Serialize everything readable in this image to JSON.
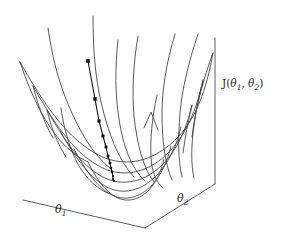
{
  "figure": {
    "background_color": "#ffffff",
    "line_color": "#3c3c3c",
    "axis_color": "#4a4a4a",
    "marker_color": "#111111"
  },
  "labels": {
    "x_axis": {
      "symbol": "θ",
      "subscript": "1",
      "text": "θ1"
    },
    "y_axis": {
      "symbol": "θ",
      "subscript": "2",
      "text": "θ2"
    },
    "z_axis": {
      "prefix": "J(",
      "first": "θ",
      "first_sub": "1",
      "separator": ", ",
      "second": "θ",
      "second_sub": "2",
      "suffix": ")",
      "text": "J(θ1, θ2)"
    }
  },
  "chart_data": {
    "type": "line",
    "xlabel": "θ1",
    "ylabel": "θ2",
    "zlabel": "J(θ1, θ2)",
    "grid": true,
    "legend": null,
    "surface": {
      "function": "J = a*(u^2) + b*(v^2)",
      "description": "Convex paraboloid (bowl) mesh surface",
      "mesh_rows": 7,
      "mesh_cols": 7,
      "u_range": [
        -1,
        1
      ],
      "v_range": [
        -1,
        1
      ],
      "z_range": [
        0,
        1
      ],
      "projection": {
        "type": "oblique-3d",
        "origin_px": [
          145,
          228
        ],
        "x_axis_vector_px": [
          -122,
          -28
        ],
        "y_axis_vector_px": [
          70,
          -44
        ],
        "z_axis_vector_px": [
          0,
          -146
        ]
      }
    },
    "axes": {
      "x_axis_line_px": [
        [
          23,
          200
        ],
        [
          145,
          228
        ]
      ],
      "y_axis_line_px": [
        [
          145,
          228
        ],
        [
          215,
          184
        ]
      ],
      "z_axis_line_px": [
        [
          215,
          184
        ],
        [
          215,
          38
        ]
      ]
    },
    "series": [
      {
        "name": "gradient descent path",
        "marker": "square",
        "markersize": 3,
        "points_uvz": [
          [
            -0.62,
            0.58,
            0.72
          ],
          [
            -0.5,
            0.44,
            0.45
          ],
          [
            -0.41,
            0.35,
            0.3
          ],
          [
            -0.33,
            0.27,
            0.19
          ],
          [
            -0.26,
            0.21,
            0.12
          ],
          [
            -0.2,
            0.16,
            0.07
          ],
          [
            -0.15,
            0.12,
            0.04
          ],
          [
            -0.11,
            0.09,
            0.02
          ],
          [
            -0.08,
            0.06,
            0.01
          ],
          [
            -0.05,
            0.04,
            0.005
          ],
          [
            -0.03,
            0.02,
            0.002
          ],
          [
            -0.01,
            0.01,
            0.0005
          ]
        ],
        "points_px": [
          [
            88,
            61
          ],
          [
            95,
            99
          ],
          [
            99,
            121
          ],
          [
            103,
            136
          ],
          [
            106,
            147
          ],
          [
            108,
            156
          ],
          [
            110,
            163
          ],
          [
            111,
            168
          ],
          [
            112,
            172
          ],
          [
            113,
            176
          ],
          [
            113,
            179
          ],
          [
            114,
            181
          ]
        ]
      }
    ]
  }
}
